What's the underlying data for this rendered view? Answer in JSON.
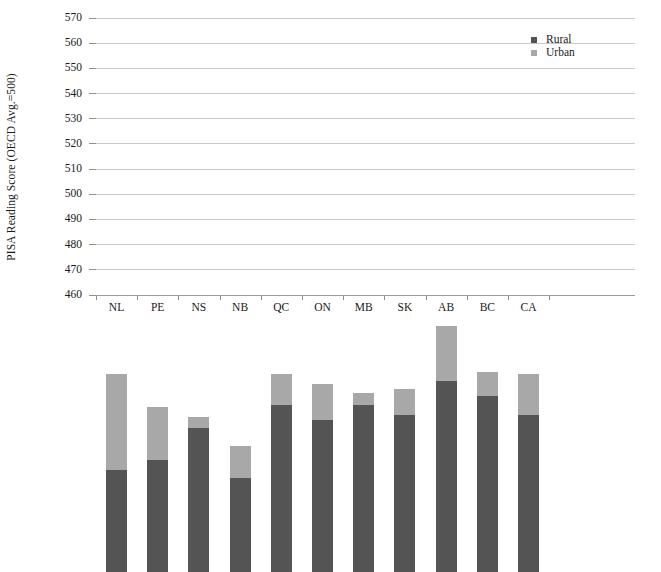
{
  "chart_data": {
    "type": "bar",
    "stacked": true,
    "title": "",
    "xlabel": "",
    "ylabel": "PISA Reading Score (OECD Avg.=500)",
    "categories": [
      "NL",
      "PE",
      "NS",
      "NB",
      "QC",
      "ON",
      "MB",
      "SK",
      "AB",
      "BC",
      "CA"
    ],
    "series": [
      {
        "name": "Rural",
        "color": "#545454",
        "values": [
          500.5,
          504.5,
          517.0,
          497.5,
          526.5,
          520.5,
          526.5,
          522.5,
          536.0,
          530.0,
          522.5
        ]
      },
      {
        "name": "Urban",
        "color": "#a8a8a8",
        "values": [
          538.5,
          525.5,
          521.5,
          510.0,
          538.5,
          534.5,
          531.0,
          532.5,
          557.5,
          539.5,
          538.5
        ]
      }
    ],
    "ylim": [
      460,
      570
    ],
    "yticks": [
      460,
      470,
      480,
      490,
      500,
      510,
      520,
      530,
      540,
      550,
      560,
      570
    ],
    "ytick_labels": [
      "460",
      "470",
      "480",
      "490",
      "500",
      "510",
      "520",
      "530",
      "540",
      "550",
      "560",
      "570"
    ],
    "grid": true,
    "legend_position": "right-top",
    "legend": [
      "Rural",
      "Urban"
    ],
    "note": "Urban series values are the stacked bar totals; the light segment spans from the Rural value up to the total."
  },
  "axes": {
    "y_title": "PISA Reading Score (OECD Avg.=500)"
  },
  "legend": {
    "items": [
      {
        "label": "Rural",
        "color": "#545454"
      },
      {
        "label": "Urban",
        "color": "#a8a8a8"
      }
    ]
  },
  "colors": {
    "rural": "#545454",
    "urban": "#a8a8a8",
    "gridline": "#c9c9c9",
    "axis": "#8f8f8f",
    "background": "#ffffff",
    "text": "#1a1a1a"
  }
}
